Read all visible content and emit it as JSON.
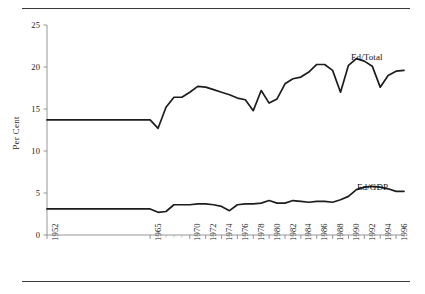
{
  "figure": {
    "top_rule": "horizontal-rule",
    "bottom_rule": "horizontal-rule"
  },
  "chart_data": {
    "type": "line",
    "title": "",
    "subtitle": "",
    "xlabel": "",
    "ylabel": "Per Cent",
    "xlim": [
      1952,
      1997
    ],
    "ylim": [
      0,
      25
    ],
    "grid": false,
    "legend_position": "inline-right",
    "ytick_values": [
      0,
      5,
      10,
      15,
      20,
      25
    ],
    "ytick_labels": [
      "0",
      "5",
      "10",
      "15",
      "20",
      "25"
    ],
    "xtick_labels": [
      "1952",
      "1965",
      "1970",
      "1972",
      "1974",
      "1976",
      "1978",
      "1980",
      "1982",
      "1984",
      "1986",
      "1988",
      "1990",
      "1992",
      "1994",
      "1996"
    ],
    "x": [
      1952,
      1965,
      1966,
      1967,
      1968,
      1969,
      1970,
      1971,
      1972,
      1973,
      1974,
      1975,
      1976,
      1977,
      1978,
      1979,
      1980,
      1981,
      1982,
      1983,
      1984,
      1985,
      1986,
      1987,
      1988,
      1989,
      1990,
      1991,
      1992,
      1993,
      1994,
      1995,
      1996,
      1997
    ],
    "series": [
      {
        "name": "Ed/Total",
        "label": "Ed/Total",
        "color": "#1d1d1d",
        "values": [
          13.7,
          13.7,
          12.7,
          15.2,
          16.4,
          16.4,
          17.0,
          17.7,
          17.6,
          17.3,
          17.0,
          16.7,
          16.3,
          16.1,
          14.8,
          17.2,
          15.7,
          16.2,
          18.0,
          18.6,
          18.8,
          19.4,
          20.3,
          20.3,
          19.6,
          17.0,
          20.2,
          21.0,
          20.7,
          20.1,
          17.6,
          19.0,
          19.5,
          19.6
        ]
      },
      {
        "name": "Ed/GDP",
        "label": "Ed/GDP",
        "color": "#1d1d1d",
        "values": [
          3.1,
          3.1,
          2.7,
          2.8,
          3.6,
          3.6,
          3.6,
          3.7,
          3.7,
          3.6,
          3.4,
          2.9,
          3.6,
          3.7,
          3.7,
          3.8,
          4.1,
          3.8,
          3.8,
          4.1,
          4.0,
          3.9,
          4.0,
          4.0,
          3.9,
          4.2,
          4.6,
          5.4,
          5.7,
          5.8,
          5.7,
          5.5,
          5.2,
          5.2
        ]
      }
    ],
    "annotations": [
      {
        "text": "Ed/Total",
        "near": "upper-right"
      },
      {
        "text": "Ed/GDP",
        "near": "lower-right"
      }
    ]
  }
}
